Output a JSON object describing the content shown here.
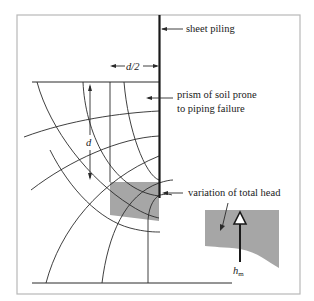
{
  "figure": {
    "type": "flow-net-diagram",
    "colors": {
      "frame": "#b8b8b8",
      "line": "#2a2a2a",
      "shade": "#a6a6a6",
      "background": "#ffffff"
    }
  },
  "labels": {
    "sheet_piling": "sheet piling",
    "half_depth": "d/2",
    "depth": "d",
    "prism_line1": "prism of soil prone",
    "prism_line2": "to piping failure",
    "variation": "variation of total head",
    "h": "h",
    "h_sub": "m"
  }
}
